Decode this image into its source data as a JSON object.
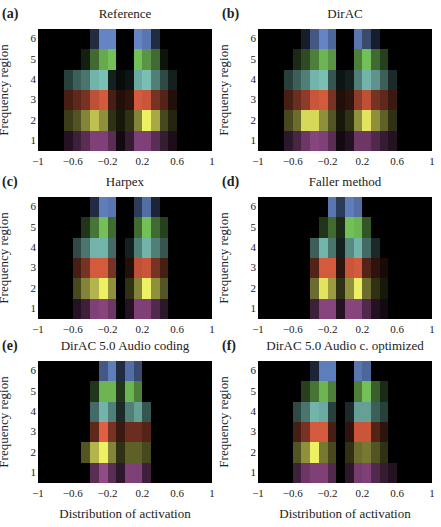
{
  "figure": {
    "xlabel": "Distribution of activation",
    "ylabel": "Frequency region",
    "yticks": [
      "6",
      "5",
      "4",
      "3",
      "2",
      "1"
    ],
    "xticks": [
      "−1",
      "−0.6",
      "−0.2",
      "0.2",
      "0.6",
      "1"
    ],
    "xtick_values": [
      -1,
      -0.6,
      -0.2,
      0.2,
      0.6,
      1
    ],
    "row_colors": [
      "#6f93dc",
      "#80d462",
      "#86d4c8",
      "#ec6444",
      "#eef064",
      "#b45ca8"
    ]
  },
  "panels": [
    {
      "letter": "(a)",
      "title": "Reference"
    },
    {
      "letter": "(b)",
      "title": "DirAC"
    },
    {
      "letter": "(c)",
      "title": "Harpex"
    },
    {
      "letter": "(d)",
      "title": "Faller method"
    },
    {
      "letter": "(e)",
      "title": "DirAC 5.0 Audio coding"
    },
    {
      "letter": "(f)",
      "title": "DirAC 5.0 Audio c. optimized"
    }
  ],
  "chart_data": [
    {
      "type": "heatmap",
      "title": "Reference",
      "panel": "(a)",
      "xlabel": "",
      "ylabel": "Frequency region",
      "xlim": [
        -1,
        1
      ],
      "rows": [
        "6",
        "5",
        "4",
        "3",
        "2",
        "1"
      ],
      "bins": 20,
      "values": [
        [
          0,
          0,
          0,
          0,
          0,
          0,
          0.3,
          0.9,
          0.9,
          0,
          0,
          0.9,
          0.8,
          0.3,
          0,
          0,
          0,
          0,
          0,
          0
        ],
        [
          0,
          0,
          0,
          0,
          0,
          0.15,
          0.5,
          0.8,
          0.9,
          0,
          0,
          0.9,
          0.7,
          0.5,
          0.1,
          0,
          0,
          0,
          0,
          0
        ],
        [
          0,
          0,
          0,
          0.3,
          0.45,
          0.55,
          0.85,
          0.9,
          0.15,
          0.05,
          0.1,
          0.8,
          0.9,
          0.6,
          0.35,
          0.15,
          0,
          0,
          0,
          0
        ],
        [
          0,
          0,
          0,
          0.3,
          0.4,
          0.5,
          0.8,
          0.9,
          0.3,
          0.15,
          0.2,
          0.9,
          0.85,
          0.5,
          0.35,
          0.15,
          0,
          0,
          0,
          0
        ],
        [
          0,
          0,
          0,
          0.25,
          0.35,
          0.55,
          0.8,
          0.6,
          0.2,
          0.1,
          0.2,
          0.55,
          1,
          0.7,
          0.3,
          0.15,
          0,
          0,
          0,
          0
        ],
        [
          0,
          0,
          0,
          0.2,
          0.35,
          0.5,
          0.7,
          0.7,
          0.5,
          0.1,
          0.3,
          0.7,
          0.7,
          0.5,
          0.3,
          0.15,
          0,
          0,
          0,
          0
        ]
      ]
    },
    {
      "type": "heatmap",
      "title": "DirAC",
      "panel": "(b)",
      "xlabel": "",
      "ylabel": "Frequency region",
      "xlim": [
        -1,
        1
      ],
      "rows": [
        "6",
        "5",
        "4",
        "3",
        "2",
        "1"
      ],
      "bins": 20,
      "values": [
        [
          0,
          0,
          0,
          0,
          0,
          0.2,
          0.6,
          0.9,
          0.7,
          0,
          0,
          0.8,
          0.5,
          0.2,
          0,
          0,
          0,
          0,
          0,
          0
        ],
        [
          0,
          0,
          0,
          0,
          0.2,
          0.35,
          0.6,
          0.85,
          0.7,
          0,
          0,
          0.6,
          0.9,
          0.5,
          0.3,
          0,
          0,
          0,
          0,
          0
        ],
        [
          0,
          0,
          0,
          0.3,
          0.45,
          0.6,
          0.85,
          0.9,
          0.4,
          0.1,
          0.15,
          0.6,
          0.85,
          0.7,
          0.45,
          0.2,
          0,
          0,
          0,
          0
        ],
        [
          0,
          0,
          0,
          0.3,
          0.45,
          0.6,
          0.85,
          0.9,
          0.5,
          0.15,
          0.2,
          0.6,
          0.8,
          0.5,
          0.4,
          0.25,
          0,
          0,
          0,
          0
        ],
        [
          0,
          0,
          0,
          0.3,
          0.45,
          0.9,
          0.9,
          0.6,
          0.35,
          0.1,
          0.2,
          0.6,
          0.95,
          0.6,
          0.4,
          0.2,
          0,
          0,
          0,
          0
        ],
        [
          0,
          0,
          0,
          0.25,
          0.4,
          0.6,
          0.75,
          0.7,
          0.5,
          0.1,
          0.2,
          0.6,
          0.6,
          0.45,
          0.3,
          0.2,
          0,
          0,
          0,
          0
        ]
      ]
    },
    {
      "type": "heatmap",
      "title": "Harpex",
      "panel": "(c)",
      "xlabel": "",
      "ylabel": "Frequency region",
      "xlim": [
        -1,
        1
      ],
      "rows": [
        "6",
        "5",
        "4",
        "3",
        "2",
        "1"
      ],
      "bins": 20,
      "values": [
        [
          0,
          0,
          0,
          0,
          0,
          0,
          0.3,
          0.85,
          0.8,
          0,
          0,
          0.4,
          0.75,
          0.25,
          0,
          0,
          0,
          0,
          0,
          0
        ],
        [
          0,
          0,
          0,
          0,
          0,
          0.25,
          0.55,
          0.9,
          0.5,
          0,
          0,
          0.5,
          0.9,
          0.5,
          0.3,
          0,
          0,
          0,
          0,
          0
        ],
        [
          0,
          0,
          0,
          0,
          0.35,
          0.55,
          0.85,
          0.85,
          0.5,
          0,
          0.15,
          0.6,
          0.85,
          0.6,
          0.4,
          0,
          0,
          0,
          0,
          0
        ],
        [
          0,
          0,
          0,
          0,
          0.3,
          0.5,
          0.9,
          0.9,
          0.5,
          0,
          0.15,
          0.8,
          0.85,
          0.5,
          0.3,
          0,
          0,
          0,
          0,
          0
        ],
        [
          0,
          0,
          0,
          0,
          0.3,
          0.55,
          0.75,
          1,
          0.6,
          0,
          0.2,
          0.55,
          1,
          0.6,
          0.35,
          0,
          0,
          0,
          0,
          0
        ],
        [
          0,
          0,
          0,
          0,
          0.2,
          0.35,
          0.7,
          0.75,
          0.6,
          0,
          0.2,
          0.7,
          0.7,
          0.45,
          0.25,
          0,
          0,
          0,
          0,
          0
        ]
      ]
    },
    {
      "type": "heatmap",
      "title": "Faller method",
      "panel": "(d)",
      "xlabel": "",
      "ylabel": "Frequency region",
      "xlim": [
        -1,
        1
      ],
      "rows": [
        "6",
        "5",
        "4",
        "3",
        "2",
        "1"
      ],
      "bins": 20,
      "values": [
        [
          0,
          0,
          0,
          0,
          0,
          0,
          0,
          0,
          0.8,
          0.4,
          0.85,
          0.75,
          0,
          0,
          0,
          0,
          0,
          0,
          0,
          0
        ],
        [
          0,
          0,
          0,
          0,
          0,
          0,
          0,
          0.25,
          0.5,
          0.2,
          0.9,
          0.85,
          0.4,
          0,
          0,
          0,
          0,
          0,
          0,
          0
        ],
        [
          0,
          0,
          0,
          0,
          0,
          0,
          0.45,
          0.85,
          0.55,
          0.15,
          0.65,
          0.85,
          0.5,
          0.2,
          0,
          0,
          0,
          0,
          0,
          0
        ],
        [
          0,
          0,
          0,
          0,
          0,
          0,
          0.35,
          0.9,
          0.9,
          0.2,
          0.85,
          0.9,
          0.35,
          0.2,
          0.1,
          0,
          0,
          0,
          0,
          0
        ],
        [
          0,
          0,
          0,
          0,
          0,
          0,
          0.45,
          0.95,
          0.65,
          0.2,
          0.6,
          1,
          0.45,
          0.2,
          0.1,
          0,
          0,
          0,
          0,
          0
        ],
        [
          0,
          0,
          0,
          0,
          0,
          0,
          0.35,
          0.75,
          0.75,
          0.2,
          0.75,
          0.75,
          0.45,
          0.2,
          0.1,
          0,
          0,
          0,
          0,
          0
        ]
      ]
    },
    {
      "type": "heatmap",
      "title": "DirAC 5.0 Audio coding",
      "panel": "(e)",
      "xlabel": "Distribution of activation",
      "ylabel": "Frequency region",
      "xlim": [
        -1,
        1
      ],
      "rows": [
        "6",
        "5",
        "4",
        "3",
        "2",
        "1"
      ],
      "bins": 20,
      "values": [
        [
          0,
          0,
          0,
          0,
          0,
          0,
          0,
          0.6,
          0.85,
          0.3,
          0.75,
          0.5,
          0,
          0,
          0,
          0,
          0,
          0,
          0,
          0
        ],
        [
          0,
          0,
          0,
          0,
          0,
          0,
          0.25,
          0.85,
          0.85,
          0.25,
          0.85,
          0.6,
          0,
          0,
          0,
          0,
          0,
          0,
          0,
          0
        ],
        [
          0,
          0,
          0,
          0,
          0,
          0,
          0.5,
          0.85,
          0.6,
          0.2,
          0.6,
          0.75,
          0.4,
          0,
          0,
          0,
          0,
          0,
          0,
          0
        ],
        [
          0,
          0,
          0,
          0,
          0,
          0,
          0.4,
          0.95,
          0.5,
          0.25,
          0.45,
          0.45,
          0.35,
          0,
          0,
          0,
          0,
          0,
          0,
          0
        ],
        [
          0,
          0,
          0,
          0,
          0,
          0.35,
          0.75,
          1,
          0.55,
          0.2,
          0.4,
          0.4,
          0.3,
          0,
          0,
          0,
          0,
          0,
          0,
          0
        ],
        [
          0,
          0,
          0,
          0,
          0,
          0,
          0.5,
          0.8,
          0.5,
          0.25,
          0.7,
          0.7,
          0.35,
          0,
          0,
          0,
          0,
          0,
          0,
          0
        ]
      ]
    },
    {
      "type": "heatmap",
      "title": "DirAC 5.0 Audio c. optimized",
      "panel": "(f)",
      "xlabel": "Distribution of activation",
      "ylabel": "Frequency region",
      "xlim": [
        -1,
        1
      ],
      "rows": [
        "6",
        "5",
        "4",
        "3",
        "2",
        "1"
      ],
      "bins": 20,
      "values": [
        [
          0,
          0,
          0,
          0,
          0,
          0,
          0.25,
          0.85,
          0.85,
          0,
          0,
          0.8,
          0.7,
          0,
          0,
          0,
          0,
          0,
          0,
          0
        ],
        [
          0,
          0,
          0,
          0,
          0,
          0.3,
          0.55,
          0.85,
          0.6,
          0,
          0,
          0.6,
          0.9,
          0.45,
          0.2,
          0,
          0,
          0,
          0,
          0
        ],
        [
          0,
          0,
          0,
          0,
          0.35,
          0.55,
          0.85,
          0.8,
          0.3,
          0,
          0.2,
          0.75,
          0.75,
          0.45,
          0.3,
          0,
          0,
          0,
          0,
          0
        ],
        [
          0,
          0,
          0,
          0,
          0.3,
          0.5,
          0.9,
          0.9,
          0.3,
          0,
          0.2,
          0.85,
          0.85,
          0.35,
          0.2,
          0,
          0,
          0,
          0,
          0
        ],
        [
          0,
          0,
          0,
          0,
          0.35,
          0.6,
          1,
          0.5,
          0.3,
          0,
          0.2,
          0.45,
          0.5,
          0.35,
          0.2,
          0,
          0,
          0,
          0,
          0
        ],
        [
          0,
          0,
          0,
          0,
          0.35,
          0.6,
          0.7,
          0.7,
          0.45,
          0,
          0.25,
          0.65,
          0.7,
          0.45,
          0.3,
          0.2,
          0,
          0,
          0,
          0
        ]
      ]
    }
  ]
}
